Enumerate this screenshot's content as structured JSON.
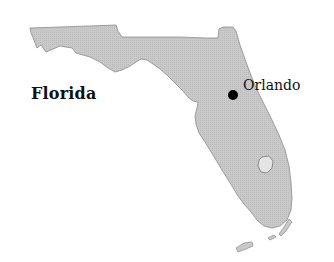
{
  "map": {
    "title": "Florida",
    "region": "Florida",
    "land_color": "#c9c9c9",
    "land_outline_color": "#8a8a8a",
    "water_color": "#ffffff",
    "lake_color": "#e4e4e4"
  },
  "labels": {
    "state": "Florida",
    "city": "Orlando"
  },
  "markers": [
    {
      "name": "Orlando",
      "icon": "city-dot-icon",
      "color": "#000000"
    }
  ],
  "features": {
    "lake": "Lake Okeechobee",
    "islands": "Florida Keys"
  }
}
